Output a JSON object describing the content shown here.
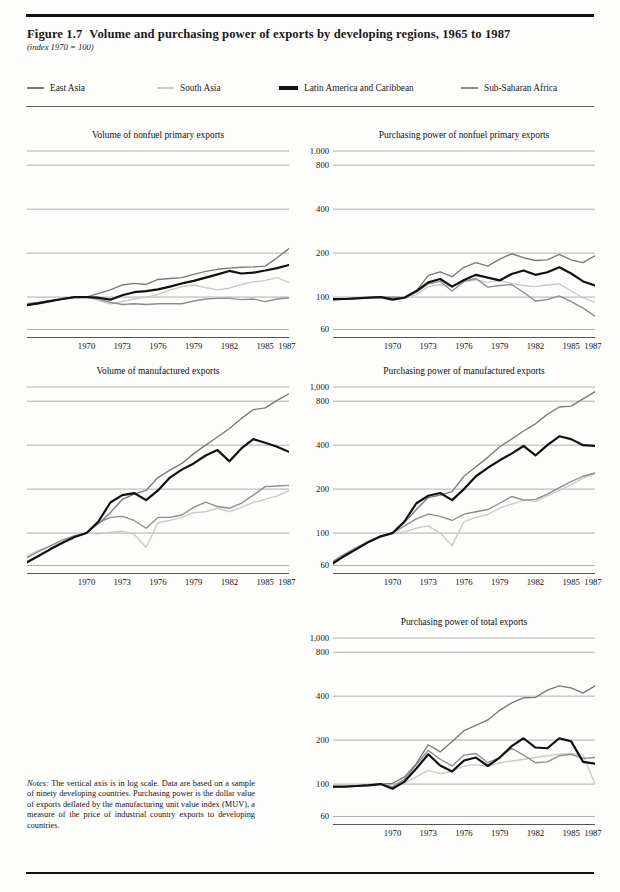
{
  "figure": {
    "number": "Figure 1.7",
    "title": "Volume and purchasing power of exports by developing regions, 1965 to 1987",
    "subtitle": "(index 1970 = 100)",
    "notes_label": "Notes:",
    "notes_text": " The vertical axis is in log scale. Data are based on a sample of ninety developing countries. Purchasing power is the dollar value of exports deflated by the manufacturing unit value index (MUV), a measure of the price of industrial country exports to developing countries."
  },
  "legend": {
    "items": [
      {
        "label": "East Asia",
        "color": "#7a7a7a",
        "x": 0,
        "swatch_width": 17
      },
      {
        "label": "South Asia",
        "color": "#c9c9c9",
        "x": 130,
        "swatch_width": 17
      },
      {
        "label": "Latin America and Caribbean",
        "color": "#111111",
        "x": 252,
        "swatch_width": 19
      },
      {
        "label": "Sub-Saharan Africa",
        "color": "#8d8d8d",
        "x": 434,
        "swatch_width": 17
      }
    ]
  },
  "axes": {
    "y_ticks_top": [
      "1.000",
      "800",
      "400",
      "200",
      "100",
      "60"
    ],
    "y_ticks_mid": [
      "1,000",
      "800",
      "400",
      "200",
      "100",
      "60"
    ],
    "y_ticks_bottom": [
      "1,000",
      "800",
      "400",
      "200",
      "100",
      "60"
    ],
    "y_values": [
      1000,
      800,
      400,
      200,
      100,
      60
    ],
    "x_ticks": [
      "1970",
      "1973",
      "1976",
      "1979",
      "1982",
      "1985",
      "1987"
    ],
    "x_tick_years": [
      1970,
      1973,
      1976,
      1979,
      1982,
      1985,
      1987
    ],
    "x_range": [
      1965,
      1987
    ],
    "scale": "log"
  },
  "chart_data": [
    {
      "id": "volume-nonfuel-primary",
      "type": "line",
      "title": "Volume of nonfuel primary exports",
      "xlabel": "",
      "ylabel": "",
      "ylim": [
        55,
        1100
      ],
      "yscale": "log",
      "grid": true,
      "legend_position": "top-shared",
      "x": [
        1965,
        1966,
        1967,
        1968,
        1969,
        1970,
        1971,
        1972,
        1973,
        1974,
        1975,
        1976,
        1977,
        1978,
        1979,
        1980,
        1981,
        1982,
        1983,
        1984,
        1985,
        1986,
        1987
      ],
      "series": [
        {
          "name": "East Asia",
          "color": "#7a7a7a",
          "values": [
            88,
            90,
            93,
            97,
            100,
            100,
            106,
            112,
            121,
            124,
            122,
            132,
            134,
            136,
            143,
            150,
            155,
            158,
            160,
            161,
            163,
            186,
            215
          ]
        },
        {
          "name": "South Asia",
          "color": "#c9c9c9",
          "values": [
            90,
            92,
            95,
            97,
            99,
            100,
            95,
            90,
            93,
            97,
            100,
            104,
            112,
            118,
            121,
            116,
            112,
            115,
            122,
            127,
            130,
            136,
            126
          ]
        },
        {
          "name": "Latin America and Caribbean",
          "color": "#111111",
          "values": [
            88,
            91,
            94,
            97,
            100,
            100,
            99,
            96,
            103,
            108,
            110,
            113,
            118,
            124,
            129,
            136,
            143,
            151,
            145,
            147,
            152,
            158,
            166
          ]
        },
        {
          "name": "Sub-Saharan Africa",
          "color": "#8d8d8d",
          "values": [
            90,
            92,
            95,
            98,
            100,
            100,
            97,
            92,
            89,
            90,
            89,
            90,
            90,
            90,
            94,
            97,
            98,
            98,
            96,
            97,
            93,
            97,
            99
          ]
        }
      ]
    },
    {
      "id": "purchasing-power-nonfuel-primary",
      "type": "line",
      "title": "Purchasing power of nonfuel primary exports",
      "xlabel": "",
      "ylabel": "",
      "ylim": [
        55,
        1100
      ],
      "yscale": "log",
      "grid": true,
      "legend_position": "top-shared",
      "x": [
        1965,
        1966,
        1967,
        1968,
        1969,
        1970,
        1971,
        1972,
        1973,
        1974,
        1975,
        1976,
        1977,
        1978,
        1979,
        1980,
        1981,
        1982,
        1983,
        1984,
        1985,
        1986,
        1987
      ],
      "series": [
        {
          "name": "East Asia",
          "color": "#7a7a7a",
          "values": [
            95,
            97,
            98,
            99,
            100,
            100,
            99,
            110,
            141,
            149,
            138,
            160,
            172,
            163,
            182,
            198,
            186,
            178,
            180,
            196,
            180,
            172,
            192
          ]
        },
        {
          "name": "South Asia",
          "color": "#c9c9c9",
          "values": [
            96,
            97,
            98,
            99,
            100,
            100,
            99,
            104,
            118,
            122,
            118,
            128,
            131,
            126,
            130,
            124,
            120,
            118,
            121,
            123,
            110,
            99,
            92
          ]
        },
        {
          "name": "Latin America and Caribbean",
          "color": "#111111",
          "values": [
            97,
            97,
            98,
            99,
            100,
            96,
            99,
            110,
            126,
            133,
            118,
            131,
            142,
            136,
            130,
            144,
            152,
            142,
            148,
            160,
            145,
            128,
            120
          ]
        },
        {
          "name": "Sub-Saharan Africa",
          "color": "#8d8d8d",
          "values": [
            97,
            97,
            98,
            99,
            100,
            97,
            100,
            108,
            123,
            128,
            110,
            128,
            134,
            117,
            120,
            122,
            108,
            94,
            96,
            102,
            93,
            84,
            74
          ]
        }
      ]
    },
    {
      "id": "volume-manufactured",
      "type": "line",
      "title": "Volume of manufactured exports",
      "xlabel": "",
      "ylabel": "",
      "ylim": [
        55,
        1100
      ],
      "yscale": "log",
      "grid": true,
      "legend_position": "top-shared",
      "x": [
        1965,
        1966,
        1967,
        1968,
        1969,
        1970,
        1971,
        1972,
        1973,
        1974,
        1975,
        1976,
        1977,
        1978,
        1979,
        1980,
        1981,
        1982,
        1983,
        1984,
        1985,
        1986,
        1987
      ],
      "series": [
        {
          "name": "East Asia",
          "color": "#7a7a7a",
          "values": [
            64,
            70,
            77,
            86,
            95,
            100,
            116,
            138,
            170,
            185,
            196,
            240,
            270,
            300,
            350,
            400,
            455,
            520,
            610,
            700,
            720,
            810,
            900
          ]
        },
        {
          "name": "South Asia",
          "color": "#c9c9c9",
          "values": [
            70,
            76,
            82,
            88,
            94,
            100,
            99,
            101,
            103,
            98,
            80,
            118,
            122,
            128,
            138,
            140,
            148,
            140,
            150,
            162,
            170,
            180,
            195
          ]
        },
        {
          "name": "Latin America and Caribbean",
          "color": "#111111",
          "values": [
            63,
            70,
            78,
            86,
            94,
            100,
            120,
            162,
            182,
            188,
            168,
            196,
            240,
            272,
            300,
            340,
            370,
            310,
            380,
            440,
            415,
            390,
            360
          ]
        },
        {
          "name": "Sub-Saharan Africa",
          "color": "#8d8d8d",
          "values": [
            68,
            75,
            82,
            90,
            96,
            100,
            118,
            128,
            130,
            122,
            108,
            128,
            128,
            133,
            150,
            163,
            152,
            148,
            160,
            182,
            208,
            210,
            212
          ]
        }
      ]
    },
    {
      "id": "purchasing-power-manufactured",
      "type": "line",
      "title": "Purchasing power of manufactured exports",
      "xlabel": "",
      "ylabel": "",
      "ylim": [
        55,
        1100
      ],
      "yscale": "log",
      "grid": true,
      "legend_position": "top-shared",
      "x": [
        1965,
        1966,
        1967,
        1968,
        1969,
        1970,
        1971,
        1972,
        1973,
        1974,
        1975,
        1976,
        1977,
        1978,
        1979,
        1980,
        1981,
        1982,
        1983,
        1984,
        1985,
        1986,
        1987
      ],
      "values_note": "",
      "series": [
        {
          "name": "East Asia",
          "color": "#7a7a7a",
          "values": [
            62,
            70,
            78,
            87,
            95,
            100,
            118,
            145,
            175,
            182,
            192,
            245,
            285,
            330,
            390,
            440,
            500,
            560,
            650,
            730,
            740,
            830,
            930
          ]
        },
        {
          "name": "South Asia",
          "color": "#c9c9c9",
          "values": [
            64,
            71,
            79,
            87,
            94,
            100,
            102,
            108,
            112,
            100,
            82,
            120,
            128,
            134,
            148,
            158,
            168,
            165,
            180,
            196,
            215,
            238,
            255
          ]
        },
        {
          "name": "Latin America and Caribbean",
          "color": "#111111",
          "values": [
            62,
            70,
            78,
            87,
            95,
            100,
            120,
            160,
            180,
            188,
            168,
            200,
            245,
            280,
            315,
            350,
            395,
            340,
            400,
            460,
            440,
            400,
            395
          ]
        },
        {
          "name": "Sub-Saharan Africa",
          "color": "#8d8d8d",
          "values": [
            64,
            72,
            80,
            88,
            95,
            100,
            112,
            125,
            135,
            130,
            122,
            135,
            140,
            145,
            160,
            178,
            168,
            170,
            185,
            205,
            225,
            245,
            258
          ]
        }
      ]
    },
    {
      "id": "purchasing-power-total",
      "type": "line",
      "title": "Purchasing power of total exports",
      "xlabel": "",
      "ylabel": "",
      "ylim": [
        55,
        1100
      ],
      "yscale": "log",
      "grid": true,
      "legend_position": "top-shared",
      "x": [
        1965,
        1966,
        1967,
        1968,
        1969,
        1970,
        1971,
        1972,
        1973,
        1974,
        1975,
        1976,
        1977,
        1978,
        1979,
        1980,
        1981,
        1982,
        1983,
        1984,
        1985,
        1986,
        1987
      ],
      "series": [
        {
          "name": "East Asia",
          "color": "#7a7a7a",
          "values": [
            95,
            96,
            97,
            99,
            100,
            101,
            112,
            138,
            186,
            166,
            196,
            232,
            252,
            275,
            320,
            360,
            390,
            392,
            440,
            470,
            455,
            420,
            470
          ]
        },
        {
          "name": "South Asia",
          "color": "#c9c9c9",
          "values": [
            95,
            96,
            98,
            99,
            100,
            100,
            102,
            112,
            124,
            118,
            122,
            133,
            136,
            132,
            140,
            144,
            148,
            152,
            156,
            160,
            162,
            158,
            100
          ]
        },
        {
          "name": "Latin America and Caribbean",
          "color": "#111111",
          "values": [
            96,
            96,
            97,
            98,
            100,
            93,
            104,
            128,
            160,
            134,
            122,
            145,
            152,
            133,
            152,
            182,
            206,
            178,
            176,
            206,
            196,
            142,
            138
          ]
        },
        {
          "name": "Sub-Saharan Africa",
          "color": "#8d8d8d",
          "values": [
            95,
            96,
            97,
            99,
            100,
            96,
            108,
            136,
            170,
            148,
            133,
            158,
            162,
            140,
            152,
            176,
            158,
            140,
            142,
            156,
            160,
            150,
            152
          ]
        }
      ]
    }
  ],
  "panels": {
    "top_left": {
      "title": "Volume of nonfuel primary exports"
    },
    "top_right": {
      "title": "Purchasing power of nonfuel primary exports"
    },
    "mid_left": {
      "title": "Volume of manufactured exports"
    },
    "mid_right": {
      "title": "Purchasing power of manufactured exports"
    },
    "bottom_right": {
      "title": "Purchasing power of total exports"
    }
  }
}
